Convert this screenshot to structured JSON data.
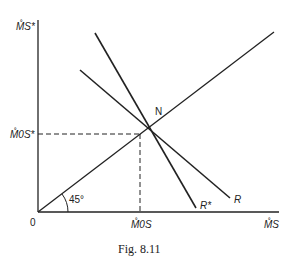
{
  "figure": {
    "caption": "Fig. 8.11",
    "y_axis_label": "M̊S*",
    "x_axis_label": "M̊S",
    "origin_label": "0",
    "y_tick_label": "M̊0S*",
    "x_tick_label": "M̊0S",
    "line_labels": {
      "forty_five": "N",
      "r_star": "R*",
      "r": "R"
    },
    "angle_label": "45°"
  }
}
